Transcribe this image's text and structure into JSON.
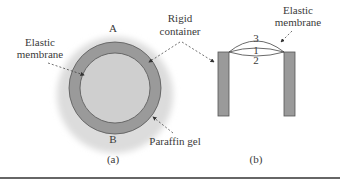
{
  "figure": {
    "panel_a": {
      "caption": "(a)",
      "label_top": "A",
      "label_bottom": "B",
      "annotations": {
        "elastic_membrane_line1": "Elastic",
        "elastic_membrane_line2": "membrane",
        "paraffin_gel": "Paraffin gel"
      }
    },
    "shared": {
      "rigid_container_line1": "Rigid",
      "rigid_container_line2": "container"
    },
    "panel_b": {
      "caption": "(b)",
      "annotations": {
        "elastic_membrane_line1": "Elastic",
        "elastic_membrane_line2": "membrane"
      },
      "curve_labels": [
        "1",
        "2",
        "3"
      ]
    },
    "colors": {
      "gel": "#d9d9d9",
      "ring": "#9a9a9a",
      "inner": "#cfcfcf",
      "container_wall": "#9a9a9a",
      "stroke": "#555555",
      "rule": "#333333"
    }
  }
}
